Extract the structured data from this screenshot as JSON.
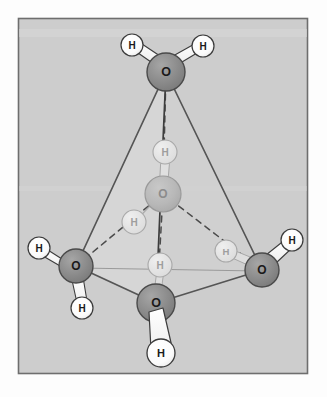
{
  "figure": {
    "frame": {
      "x": 18,
      "y": 18,
      "width": 290,
      "height": 356,
      "border_color": "#6e6e6e",
      "background_color": "#cdcdcd",
      "inner_shade_color": "#d4d4d4"
    },
    "colors": {
      "oxygen_front": "#8a8a8a",
      "oxygen_front_outline": "#4a4a4a",
      "oxygen_back": "#b6b6b6",
      "oxygen_back_outline": "#9a9a9a",
      "hydrogen_front": "#ffffff",
      "hydrogen_front_outline": "#3a3a3a",
      "hydrogen_back": "#e2e2e2",
      "hydrogen_back_outline": "#a8a8a8",
      "bond_front": "#ffffff",
      "bond_front_outline": "#3c3c3c",
      "bond_back": "#dcdcdc",
      "bond_back_outline": "#a8a8a8",
      "tetra_edge_solid": "#555555",
      "tetra_edge_dashed": "#4b4b4b",
      "tetra_face_fill": "#d6d6d6",
      "label_dark": "#1a1a1a",
      "label_faded": "#8c8c8c"
    }
  },
  "molecules": [
    {
      "id": "water-top",
      "name": "top-water-molecule",
      "depth": "front",
      "oxygen": {
        "label": "O",
        "cx": 166,
        "cy": 72,
        "r": 19
      },
      "hydrogens": [
        {
          "label": "H",
          "cx": 132,
          "cy": 45,
          "r": 11
        },
        {
          "label": "H",
          "cx": 203,
          "cy": 46,
          "r": 11
        }
      ]
    },
    {
      "id": "water-center",
      "name": "central-water-molecule",
      "depth": "back",
      "oxygen": {
        "label": "O",
        "cx": 163,
        "cy": 194,
        "r": 18
      },
      "hydrogens": [
        {
          "label": "H",
          "cx": 165,
          "cy": 152,
          "r": 12
        },
        {
          "label": "H",
          "cx": 134,
          "cy": 222,
          "r": 12
        }
      ]
    },
    {
      "id": "water-left",
      "name": "left-water-molecule",
      "depth": "front",
      "oxygen": {
        "label": "O",
        "cx": 76,
        "cy": 266,
        "r": 17
      },
      "hydrogens": [
        {
          "label": "H",
          "cx": 39,
          "cy": 248,
          "r": 11
        },
        {
          "label": "H",
          "cx": 82,
          "cy": 308,
          "r": 11
        }
      ]
    },
    {
      "id": "water-right",
      "name": "right-water-molecule",
      "depth": "front",
      "oxygen": {
        "label": "O",
        "cx": 262,
        "cy": 270,
        "r": 17
      },
      "hydrogens": [
        {
          "label": "H",
          "cx": 292,
          "cy": 240,
          "r": 11
        },
        {
          "label": "H",
          "cx": 226,
          "cy": 251,
          "r": 11,
          "depth": "back"
        }
      ]
    },
    {
      "id": "water-bottom",
      "name": "bottom-water-molecule",
      "depth": "front",
      "oxygen": {
        "label": "O",
        "cx": 156,
        "cy": 303,
        "r": 19
      },
      "hydrogens": [
        {
          "label": "H",
          "cx": 161,
          "cy": 353,
          "r": 14
        },
        {
          "label": "H",
          "cx": 160,
          "cy": 265,
          "r": 12,
          "depth": "back"
        }
      ]
    }
  ],
  "tetrahedron": {
    "vertices": {
      "apex": [
        166,
        72
      ],
      "left": [
        76,
        266
      ],
      "right": [
        262,
        270
      ],
      "front": [
        156,
        303
      ]
    },
    "solid_edges": [
      {
        "name": "apex-to-left",
        "from": [
          166,
          72
        ],
        "to": [
          76,
          266
        ]
      },
      {
        "name": "apex-to-right",
        "from": [
          166,
          72
        ],
        "to": [
          262,
          270
        ]
      },
      {
        "name": "apex-to-front",
        "from": [
          166,
          72
        ],
        "to": [
          156,
          303
        ]
      },
      {
        "name": "left-to-front",
        "from": [
          76,
          266
        ],
        "to": [
          156,
          303
        ]
      },
      {
        "name": "right-to-front",
        "from": [
          262,
          270
        ],
        "to": [
          156,
          303
        ]
      }
    ],
    "dashed_edges": [
      {
        "name": "left-to-center-hbond",
        "from": [
          76,
          266
        ],
        "to": [
          163,
          194
        ]
      },
      {
        "name": "right-to-center-hbond",
        "from": [
          262,
          270
        ],
        "to": [
          163,
          194
        ]
      },
      {
        "name": "apex-to-center-hbond",
        "from": [
          166,
          72
        ],
        "to": [
          163,
          194
        ]
      },
      {
        "name": "center-to-front-hbond",
        "from": [
          163,
          194
        ],
        "to": [
          156,
          303
        ]
      },
      {
        "name": "left-to-right-hidden",
        "from": [
          76,
          266
        ],
        "to": [
          262,
          270
        ]
      }
    ]
  }
}
